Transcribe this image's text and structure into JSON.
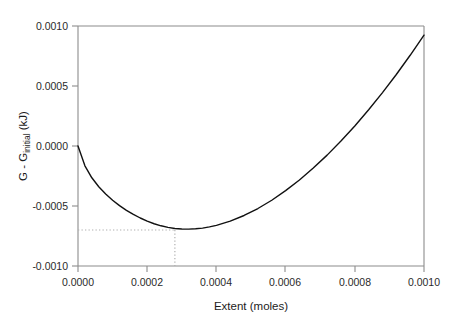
{
  "chart_data": {
    "type": "line",
    "title": "",
    "xlabel": "Extent (moles)",
    "ylabel_main": "G - G",
    "ylabel_sub": "initial",
    "ylabel_unit": " (kJ)",
    "ylabel_full": "G - Ginitial (kJ)",
    "xlim": [
      0.0,
      0.001
    ],
    "ylim": [
      -0.001,
      0.001
    ],
    "grid": false,
    "legend": "none",
    "xticks": [
      "0.0000",
      "0.0002",
      "0.0004",
      "0.0006",
      "0.0008",
      "0.0010"
    ],
    "xtick_values": [
      0.0,
      0.0002,
      0.0004,
      0.0006,
      0.0008,
      0.001
    ],
    "yticks": [
      "0.0010",
      "0.0005",
      "0.0000",
      "-0.0005",
      "-0.0010"
    ],
    "ytick_values": [
      0.001,
      0.0005,
      0.0,
      -0.0005,
      -0.001
    ],
    "series": [
      {
        "name": "Gibbs free energy change",
        "x": [
          0.0,
          2e-05,
          4e-05,
          6e-05,
          8e-05,
          0.0001,
          0.00012,
          0.00014,
          0.00016,
          0.00018,
          0.0002,
          0.00022,
          0.00024,
          0.00026,
          0.00028,
          0.0003,
          0.00032,
          0.00034,
          0.00036,
          0.00038,
          0.0004,
          0.00044,
          0.00048,
          0.00052,
          0.00056,
          0.0006,
          0.00064,
          0.00068,
          0.00072,
          0.00076,
          0.0008,
          0.00084,
          0.00088,
          0.00092,
          0.00096,
          0.001
        ],
        "y": [
          0.0,
          -0.000165,
          -0.000265,
          -0.00034,
          -0.0004,
          -0.000452,
          -0.000497,
          -0.000536,
          -0.00057,
          -0.0006,
          -0.000626,
          -0.000648,
          -0.000665,
          -0.000678,
          -0.000687,
          -0.000692,
          -0.000693,
          -0.00069,
          -0.000684,
          -0.000674,
          -0.000661,
          -0.000626,
          -0.000579,
          -0.000521,
          -0.000452,
          -0.000372,
          -0.000283,
          -0.000184,
          -7.6e-05,
          4.1e-05,
          0.000167,
          0.000302,
          0.000445,
          0.000596,
          0.000756,
          0.000924
        ]
      }
    ],
    "annotations": {
      "minimum_point": {
        "x": 0.00028,
        "y": -0.0007
      },
      "guide_lines": "dotted horizontal from y-axis to minimum and dotted vertical from minimum to x-axis"
    }
  }
}
